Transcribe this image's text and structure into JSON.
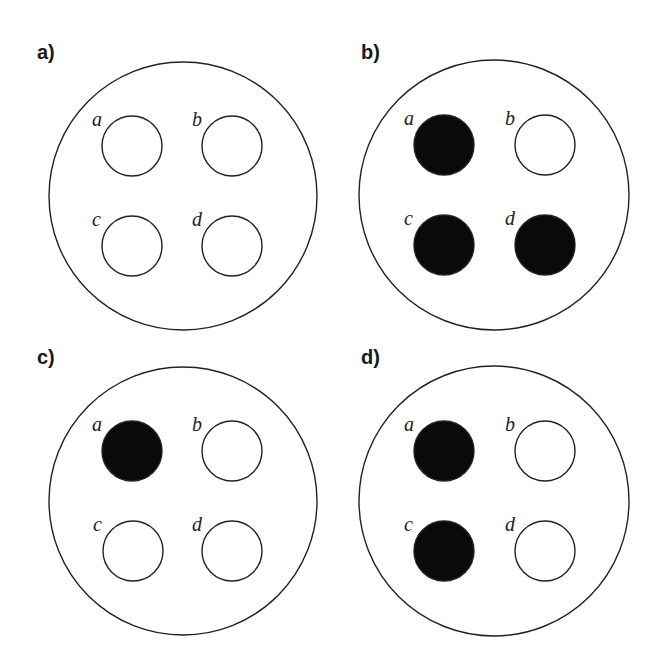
{
  "colors": {
    "filled": "#0a0a0a",
    "empty": "#ffffff",
    "stroke": "#222222"
  },
  "panels": [
    {
      "id": "a",
      "label": "a)",
      "label_pos": [
        37,
        59
      ],
      "outer": {
        "cx": 183,
        "cy": 196,
        "r": 134
      },
      "holes": [
        {
          "name": "a",
          "cx": 132,
          "cy": 146,
          "r": 30,
          "filled": false
        },
        {
          "name": "b",
          "cx": 232,
          "cy": 146,
          "r": 30,
          "filled": false
        },
        {
          "name": "c",
          "cx": 132,
          "cy": 246,
          "r": 30,
          "filled": false
        },
        {
          "name": "d",
          "cx": 232,
          "cy": 246,
          "r": 30,
          "filled": false
        }
      ]
    },
    {
      "id": "b",
      "label": "b)",
      "label_pos": [
        361,
        59
      ],
      "outer": {
        "cx": 494,
        "cy": 195,
        "r": 135
      },
      "holes": [
        {
          "name": "a",
          "cx": 444,
          "cy": 145,
          "r": 30,
          "filled": true
        },
        {
          "name": "b",
          "cx": 545,
          "cy": 145,
          "r": 30,
          "filled": false
        },
        {
          "name": "c",
          "cx": 444,
          "cy": 245,
          "r": 30,
          "filled": true
        },
        {
          "name": "d",
          "cx": 545,
          "cy": 245,
          "r": 30,
          "filled": true
        }
      ]
    },
    {
      "id": "c",
      "label": "c)",
      "label_pos": [
        37,
        364
      ],
      "outer": {
        "cx": 183,
        "cy": 501,
        "r": 134
      },
      "holes": [
        {
          "name": "a",
          "cx": 132,
          "cy": 451,
          "r": 30,
          "filled": true
        },
        {
          "name": "b",
          "cx": 232,
          "cy": 451,
          "r": 30,
          "filled": false
        },
        {
          "name": "c",
          "cx": 133,
          "cy": 551,
          "r": 30,
          "filled": false
        },
        {
          "name": "d",
          "cx": 232,
          "cy": 551,
          "r": 30,
          "filled": false
        }
      ]
    },
    {
      "id": "d",
      "label": "d)",
      "label_pos": [
        361,
        364
      ],
      "outer": {
        "cx": 494,
        "cy": 501,
        "r": 135
      },
      "holes": [
        {
          "name": "a",
          "cx": 444,
          "cy": 451,
          "r": 30,
          "filled": true
        },
        {
          "name": "b",
          "cx": 545,
          "cy": 451,
          "r": 30,
          "filled": false
        },
        {
          "name": "c",
          "cx": 444,
          "cy": 551,
          "r": 30,
          "filled": true
        },
        {
          "name": "d",
          "cx": 545,
          "cy": 551,
          "r": 30,
          "filled": false
        }
      ]
    }
  ]
}
